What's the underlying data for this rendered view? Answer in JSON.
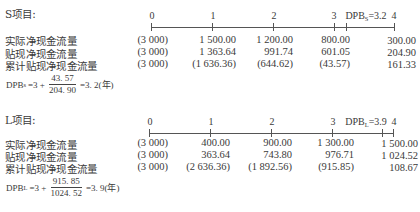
{
  "sections": [
    {
      "id": "S",
      "title": "S项目:",
      "timeline": {
        "periods": [
          "0",
          "1",
          "2",
          "3",
          "4"
        ],
        "dpb_marker_prefix": "DPB",
        "dpb_marker_sub": "S",
        "dpb_marker_value": "=3.2",
        "dpb_value": 3.2
      },
      "rows": [
        {
          "label": "实际净现金流量",
          "values": [
            "(3 000)",
            "1 500.00",
            "1 200.00",
            "800.00",
            "300.00"
          ]
        },
        {
          "label": "贴现净现金流量",
          "values": [
            "(3 000)",
            "1 363.64",
            "991.74",
            "601.05",
            "204.90"
          ]
        },
        {
          "label": "累计贴现净现金流量",
          "values": [
            "(3 000)",
            "(1 636.36)",
            "(644.62)",
            "(43.57)",
            "161.33"
          ]
        }
      ],
      "formula": {
        "lhs": "DPB",
        "lhs_sub": "s",
        "prefix": "=3 +",
        "numerator": "43. 57",
        "denominator": "204. 90",
        "result": "=3. 2(年)"
      }
    },
    {
      "id": "L",
      "title": "L项目:",
      "timeline": {
        "periods": [
          "0",
          "1",
          "2",
          "3",
          "4"
        ],
        "dpb_marker_prefix": "DPB",
        "dpb_marker_sub": "L",
        "dpb_marker_value": "=3.9",
        "dpb_value": 3.9
      },
      "rows": [
        {
          "label": "实际净现金流量",
          "values": [
            "(3 000)",
            "400.00",
            "900.00",
            "1 300.00",
            "1 500.00"
          ]
        },
        {
          "label": "贴现净现金流量",
          "values": [
            "(3 000)",
            "363.64",
            "743.80",
            "976.71",
            "1 024.52"
          ]
        },
        {
          "label": "累计贴现净现金流量",
          "values": [
            "(3 000)",
            "(2 636.36)",
            "(1 892.56)",
            "(915.85)",
            "108.67"
          ]
        }
      ],
      "formula": {
        "lhs": "DPB",
        "lhs_sub": "L",
        "prefix": "=3 +",
        "numerator": "915. 85",
        "denominator": "1024. 52",
        "result": "=3. 9(年)"
      }
    }
  ]
}
